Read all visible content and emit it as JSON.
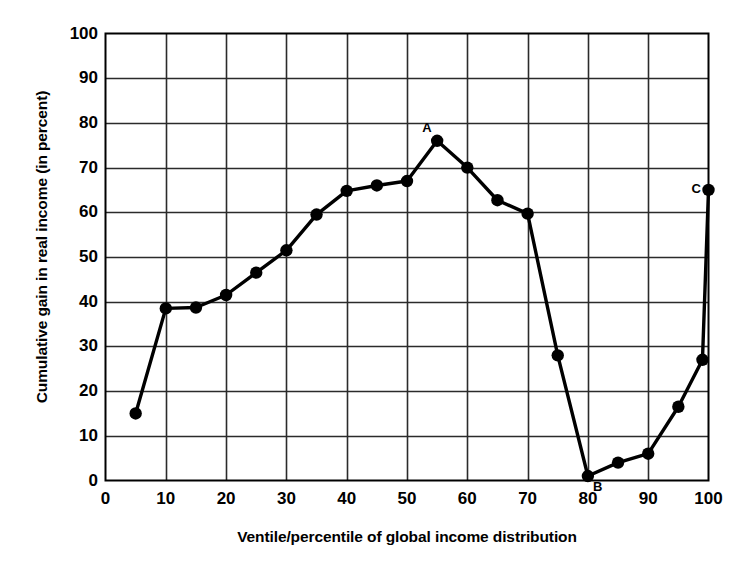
{
  "chart_data": {
    "type": "line",
    "title": "",
    "subtitle": "",
    "xlabel": "Ventile/percentile of global income distribution",
    "ylabel": "Cumulative gain in real income (in percent)",
    "xlim": [
      0,
      100
    ],
    "ylim": [
      0,
      100
    ],
    "xticks": [
      0,
      10,
      20,
      30,
      40,
      50,
      60,
      70,
      80,
      90,
      100
    ],
    "yticks": [
      0,
      10,
      20,
      30,
      40,
      50,
      60,
      70,
      80,
      90,
      100
    ],
    "grid": true,
    "legend": null,
    "legend_position": "none",
    "marker": "filled-circle",
    "line_color": "#000000",
    "series": [
      {
        "name": "Cumulative gain in real income",
        "x": [
          5,
          10,
          15,
          20,
          25,
          30,
          35,
          40,
          45,
          50,
          55,
          60,
          65,
          70,
          75,
          80,
          85,
          90,
          95,
          99,
          100
        ],
        "values": [
          15,
          38.5,
          38.7,
          41.5,
          46.5,
          51.5,
          59.5,
          64.8,
          66,
          67,
          76,
          70,
          62.7,
          59.7,
          28,
          1,
          4,
          6,
          16.5,
          27,
          65
        ]
      }
    ],
    "annotations": [
      {
        "label": "A",
        "x": 55,
        "y": 76
      },
      {
        "label": "B",
        "x": 80,
        "y": 1
      },
      {
        "label": "C",
        "x": 100,
        "y": 65
      }
    ]
  },
  "axes": {
    "x_title": "Ventile/percentile of global income distribution",
    "y_title": "Cumulative gain in real income (in percent)",
    "x_tick_labels": [
      "0",
      "10",
      "20",
      "30",
      "40",
      "50",
      "60",
      "70",
      "80",
      "90",
      "100"
    ],
    "y_tick_labels": [
      "0",
      "10",
      "20",
      "30",
      "40",
      "50",
      "60",
      "70",
      "80",
      "90",
      "100"
    ]
  },
  "colors": {
    "line": "#000000",
    "marker": "#000000",
    "grid": "#2b2b2b",
    "axis": "#000000",
    "background": "#ffffff",
    "text": "#000000"
  }
}
